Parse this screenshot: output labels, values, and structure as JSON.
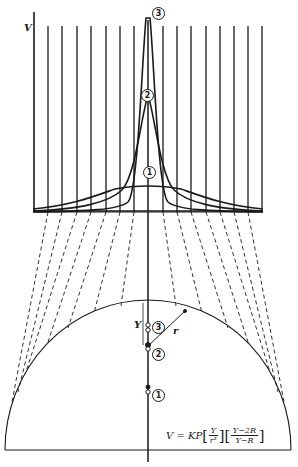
{
  "figure": {
    "axis_label": "V",
    "curves": [
      {
        "id": "1",
        "label": "1",
        "peak_y": 186
      },
      {
        "id": "2",
        "label": "2",
        "peak_y": 96
      },
      {
        "id": "3",
        "label": "3",
        "peak_y": 14
      }
    ],
    "source_markers": [
      {
        "label": "1",
        "note": "dipole position 1"
      },
      {
        "label": "2",
        "note": "dipole position 2"
      },
      {
        "label": "3",
        "note": "dipole position 3"
      }
    ],
    "distance_label": "Y",
    "radius_label": "r",
    "formula": {
      "lhs": "V = KP",
      "frac1_num": "Y",
      "frac1_den": "r³",
      "frac2_num": "Y−2R",
      "frac2_den": "Y−R"
    }
  }
}
